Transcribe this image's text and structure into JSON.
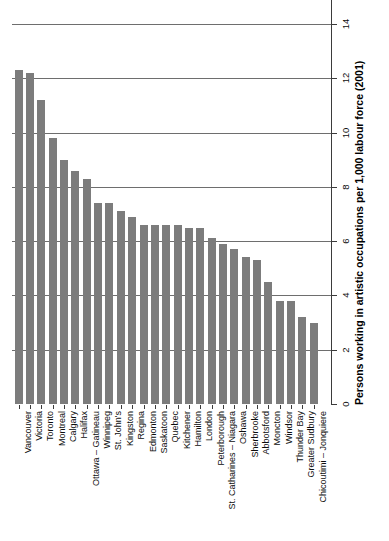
{
  "chart_data": {
    "type": "bar",
    "title": "",
    "subtitle": "",
    "xlabel": "",
    "ylabel": "Persons working in artistic occupations per 1,000  labour force (2001)",
    "ylim": [
      0,
      14
    ],
    "ytick_values": [
      0,
      2,
      4,
      6,
      8,
      10,
      12,
      14
    ],
    "ytick_labels": [
      "0",
      "2",
      "4",
      "6",
      "8",
      "10",
      "12",
      "14"
    ],
    "grid": "horizontal",
    "legend": "none",
    "orientation": "vertical",
    "bar_color": "#7c7c7c",
    "categories": [
      "Vancouver",
      "Victoria",
      "Toronto",
      "Montreal",
      "Calgary",
      "Halifax",
      "Ottawa – Gatineau",
      "Winnipeg",
      "St. John's",
      "Kingston",
      "Regina",
      "Edmonton",
      "Saskatoon",
      "Quebec",
      "Kitchener",
      "Hamilton",
      "London",
      "Peterborough",
      "St. Catharines – Niagara",
      "Oshawa",
      "Sherbrooke",
      "Abbotsford",
      "Moncton",
      "Windsor",
      "Thunder Bay",
      "Greater Sudbury",
      "Chicoutimi – Jonquiere"
    ],
    "values": [
      12.3,
      12.2,
      11.2,
      9.8,
      9.0,
      8.6,
      8.3,
      7.4,
      7.4,
      7.1,
      6.9,
      6.6,
      6.6,
      6.6,
      6.6,
      6.5,
      6.5,
      6.1,
      5.9,
      5.7,
      5.4,
      5.3,
      4.5,
      3.8,
      3.8,
      3.2,
      3.0
    ]
  }
}
